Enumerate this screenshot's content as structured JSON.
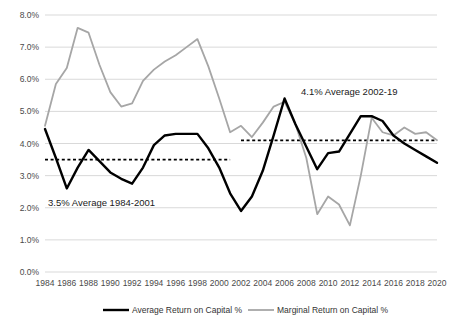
{
  "chart_data": {
    "type": "line",
    "title": "",
    "xlabel": "",
    "ylabel": "",
    "ylim": [
      0.0,
      8.0
    ],
    "ytick_step": 1.0,
    "ytick_labels": [
      "0.0%",
      "1.0%",
      "2.0%",
      "3.0%",
      "4.0%",
      "5.0%",
      "6.0%",
      "7.0%",
      "8.0%"
    ],
    "grid": true,
    "legend_position": "bottom",
    "x": [
      1984,
      1985,
      1986,
      1987,
      1988,
      1989,
      1990,
      1991,
      1992,
      1993,
      1994,
      1995,
      1996,
      1997,
      1998,
      1999,
      2000,
      2001,
      2002,
      2003,
      2004,
      2005,
      2006,
      2007,
      2008,
      2009,
      2010,
      2011,
      2012,
      2013,
      2014,
      2015,
      2016,
      2017,
      2018,
      2019,
      2020
    ],
    "xtick_labels": [
      "1984",
      "1986",
      "1988",
      "1990",
      "1992",
      "1994",
      "1996",
      "1998",
      "2000",
      "2002",
      "2004",
      "2006",
      "2008",
      "2010",
      "2012",
      "2014",
      "2016",
      "2018",
      "2020"
    ],
    "series": [
      {
        "name": "Average Return on Capital %",
        "color": "#000000",
        "width": 2.4,
        "values": [
          4.45,
          3.55,
          2.6,
          3.25,
          3.8,
          3.45,
          3.1,
          2.9,
          2.75,
          3.25,
          3.95,
          4.25,
          4.3,
          4.3,
          4.3,
          3.85,
          3.25,
          2.45,
          1.9,
          2.35,
          3.15,
          4.25,
          5.4,
          4.6,
          3.9,
          3.2,
          3.7,
          3.75,
          4.3,
          4.85,
          4.85,
          4.7,
          4.25,
          4.0,
          3.8,
          3.6,
          3.4
        ]
      },
      {
        "name": "Marginal Return on Capital %",
        "color": "#a6a6a6",
        "width": 1.8,
        "values": [
          4.55,
          5.85,
          6.35,
          7.6,
          7.45,
          6.45,
          5.6,
          5.15,
          5.25,
          5.95,
          6.3,
          6.55,
          6.75,
          7.0,
          7.25,
          6.4,
          5.4,
          4.35,
          4.55,
          4.2,
          4.65,
          5.15,
          5.3,
          4.6,
          3.55,
          1.8,
          2.35,
          2.1,
          1.45,
          3.0,
          4.8,
          4.35,
          4.25,
          4.5,
          4.3,
          4.35,
          4.1
        ]
      }
    ],
    "reference_lines": [
      {
        "name": "avg-1984-2001",
        "value": 3.5,
        "x_start": 1984,
        "x_end": 2001,
        "style": "dashed",
        "color": "#000000"
      },
      {
        "name": "avg-2002-2019",
        "value": 4.1,
        "x_start": 2002,
        "x_end": 2020,
        "style": "dashed",
        "color": "#000000"
      }
    ],
    "annotations": [
      {
        "name": "annotation-average-1984-2001",
        "text": "3.5% Average 1984-2001",
        "x_px": 48,
        "y_px": 206
      },
      {
        "name": "annotation-average-2002-2019",
        "text": "4.1% Average 2002-19",
        "x_px": 301,
        "y_px": 95
      }
    ]
  },
  "legend": {
    "items": [
      {
        "label": "Average Return on Capital %",
        "color": "#000000"
      },
      {
        "label": "Marginal Return on Capital %",
        "color": "#a6a6a6"
      }
    ]
  }
}
